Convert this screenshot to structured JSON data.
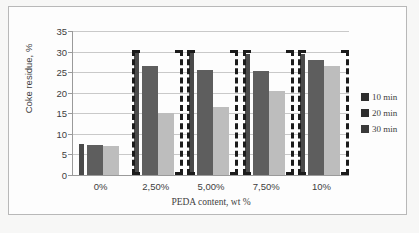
{
  "chart_data": {
    "type": "bar",
    "title": "",
    "xlabel": "PEDA content, wt %",
    "ylabel": "Coke residue, %",
    "categories": [
      "0%",
      "2,50%",
      "5,00%",
      "7,50%",
      "10%"
    ],
    "series": [
      {
        "name": "10 min",
        "values": [
          7.5,
          29.8,
          29.6,
          29.4,
          29.3
        ],
        "color": "#4a4a4a"
      },
      {
        "name": "20 min",
        "values": [
          7.3,
          26.4,
          25.6,
          25.3,
          28.0
        ],
        "color": "#5e5e5e"
      },
      {
        "name": "30 min",
        "values": [
          7.0,
          15.0,
          16.5,
          20.3,
          26.5
        ],
        "color": "#bdbdbd"
      }
    ],
    "ylim": [
      0,
      35
    ],
    "yticks": [
      "0",
      "5",
      "10",
      "15",
      "20",
      "25",
      "30",
      "35"
    ],
    "grid": true,
    "legend_position": "right",
    "legend_entries": [
      "10 min",
      "20 min",
      "30 min"
    ]
  },
  "axes": {
    "y_title": "Coke residue, %",
    "x_title": "PEDA content, wt %"
  }
}
